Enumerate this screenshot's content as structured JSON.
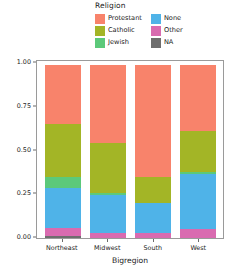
{
  "chart_data": {
    "type": "bar",
    "stacked": true,
    "normalized": true,
    "title": "",
    "xlabel": "Bigregion",
    "ylabel": "Count",
    "categories": [
      "Northeast",
      "Midwest",
      "South",
      "West"
    ],
    "ylim": [
      0,
      1
    ],
    "yticks": [
      "0.00",
      "0.25",
      "0.50",
      "0.75",
      "1.00"
    ],
    "ytick_values": [
      0,
      0.25,
      0.5,
      0.75,
      1
    ],
    "grid": false,
    "legend_title": "Religion",
    "legend_position": "top",
    "series": [
      {
        "name": "Protestant",
        "color": "#f8836b",
        "values": [
          0.34,
          0.45,
          0.65,
          0.38
        ]
      },
      {
        "name": "Catholic",
        "color": "#a3b526",
        "values": [
          0.31,
          0.29,
          0.15,
          0.24
        ]
      },
      {
        "name": "Jewish",
        "color": "#5cc97a",
        "values": [
          0.06,
          0.01,
          0.0,
          0.01
        ]
      },
      {
        "name": "None",
        "color": "#4fb3e8",
        "values": [
          0.23,
          0.22,
          0.17,
          0.32
        ]
      },
      {
        "name": "Other",
        "color": "#d96bb0",
        "values": [
          0.05,
          0.03,
          0.03,
          0.05
        ]
      },
      {
        "name": "NA",
        "color": "#6e6e6e",
        "values": [
          0.01,
          0.0,
          0.0,
          0.0
        ]
      }
    ]
  },
  "legend": {
    "title": "Religion",
    "columns": [
      [
        {
          "label": "Protestant",
          "color": "#f8836b"
        },
        {
          "label": "Catholic",
          "color": "#a3b526"
        },
        {
          "label": "Jewish",
          "color": "#5cc97a"
        }
      ],
      [
        {
          "label": "None",
          "color": "#4fb3e8"
        },
        {
          "label": "Other",
          "color": "#d96bb0"
        },
        {
          "label": "NA",
          "color": "#6e6e6e"
        }
      ]
    ]
  },
  "axes": {
    "y_label": "Count",
    "x_label": "Bigregion",
    "y_ticks": [
      "0.00",
      "0.25",
      "0.50",
      "0.75",
      "1.00"
    ],
    "x_ticks": [
      "Northeast",
      "Midwest",
      "South",
      "West"
    ]
  }
}
